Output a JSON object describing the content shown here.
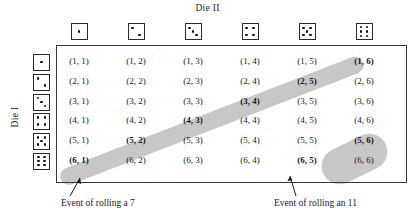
{
  "figure": {
    "die2_title": "Die II",
    "die1_title": "Die I"
  },
  "axes": {
    "columns": [
      {
        "value": 1,
        "icon": "die-face-1-icon"
      },
      {
        "value": 2,
        "icon": "die-face-2-icon"
      },
      {
        "value": 3,
        "icon": "die-face-3-icon"
      },
      {
        "value": 4,
        "icon": "die-face-4-icon"
      },
      {
        "value": 5,
        "icon": "die-face-5-icon"
      },
      {
        "value": 6,
        "icon": "die-face-6-icon"
      }
    ],
    "rows": [
      {
        "value": 1,
        "icon": "die-face-1-icon"
      },
      {
        "value": 2,
        "icon": "die-face-2-icon"
      },
      {
        "value": 3,
        "icon": "die-face-3-icon"
      },
      {
        "value": 4,
        "icon": "die-face-4-icon"
      },
      {
        "value": 5,
        "icon": "die-face-5-icon"
      },
      {
        "value": 6,
        "icon": "die-face-6-icon"
      }
    ]
  },
  "grid": {
    "rows": [
      [
        "(1, 1)",
        "(1, 2)",
        "(1, 3)",
        "(1, 4)",
        "(1, 5)",
        "(1, 6)"
      ],
      [
        "(2, 1)",
        "(2, 2)",
        "(2, 3)",
        "(2, 4)",
        "(2, 5)",
        "(2, 6)"
      ],
      [
        "(3, 1)",
        "(3, 2)",
        "(3, 3)",
        "(3, 4)",
        "(3, 5)",
        "(3, 6)"
      ],
      [
        "(4, 1)",
        "(4, 2)",
        "(4, 3)",
        "(4, 4)",
        "(4, 5)",
        "(4, 6)"
      ],
      [
        "(5, 1)",
        "(5, 2)",
        "(5, 3)",
        "(5, 4)",
        "(5, 5)",
        "(5, 6)"
      ],
      [
        "(6, 1)",
        "(6, 2)",
        "(6, 3)",
        "(6, 4)",
        "(6, 5)",
        "(6, 6)"
      ]
    ]
  },
  "events": {
    "seven": {
      "caption": "Event of rolling a 7",
      "outcomes": [
        "(1, 6)",
        "(2, 5)",
        "(3, 4)",
        "(4, 3)",
        "(5, 2)",
        "(6, 1)"
      ]
    },
    "eleven": {
      "caption": "Event of rolling an 11",
      "outcomes": [
        "(5, 6)",
        "(6, 5)"
      ]
    }
  },
  "colors": {
    "highlight": "#c7c7c7",
    "line": "#3a3a3a",
    "text": "#1a1a1a"
  }
}
